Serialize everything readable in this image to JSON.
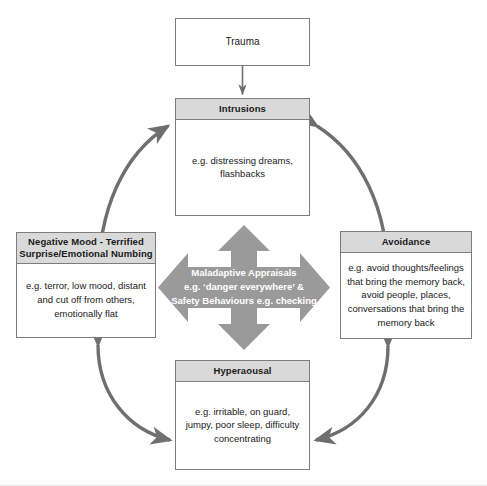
{
  "diagram": {
    "colors": {
      "header_fill": "#d9d9d9",
      "box_border": "#7d7d7d",
      "box_fill": "#ffffff",
      "cross_arrow_fill": "#9a9a9a",
      "curved_arrow_stroke": "#6f6f6f",
      "text": "#1a1a1a",
      "cross_label_text": "#ffffff",
      "background": "#ffffff"
    },
    "nodes": {
      "trauma": {
        "label": "Trauma"
      },
      "intrusions": {
        "header": "Intrusions",
        "body": "e.g. distressing dreams, flashbacks"
      },
      "negative_mood": {
        "header": "Negative Mood - Terrified Surprise/Emotional Numbing",
        "header_line1": "Negative Mood - Terrified",
        "header_line2": "Surprise/Emotional Numbing",
        "body": "e.g. terror, low mood, distant and cut off from others, emotionally flat"
      },
      "avoidance": {
        "header": "Avoidance",
        "body": "e.g. avoid thoughts/feelings that bring the memory back, avoid people, places, conversations that bring the memory back"
      },
      "hyperarousal": {
        "header": "Hyperaousal",
        "body": "e.g. irritable, on guard, jumpy, poor sleep, difficulty concentrating"
      },
      "central": {
        "line1": "Maladaptive Appraisals",
        "line2": "e.g. ‘danger everywhere’ &",
        "line3": "Safety Behaviours e.g. checking"
      }
    },
    "connectors": [
      {
        "name": "trauma-to-intrusions",
        "from": "Trauma",
        "to": "Intrusions",
        "style": "straight",
        "heads": "single"
      },
      {
        "name": "intrusions-negative-mood",
        "from": "Intrusions",
        "to": "Negative Mood",
        "style": "curved",
        "heads": "double"
      },
      {
        "name": "intrusions-avoidance",
        "from": "Intrusions",
        "to": "Avoidance",
        "style": "curved",
        "heads": "double"
      },
      {
        "name": "negative-mood-hyperarousal",
        "from": "Negative Mood",
        "to": "Hyperaousal",
        "style": "curved",
        "heads": "double"
      },
      {
        "name": "avoidance-hyperarousal",
        "from": "Avoidance",
        "to": "Hyperaousal",
        "style": "curved",
        "heads": "double"
      },
      {
        "name": "central-cross-arrow",
        "from": "Maladaptive Appraisals",
        "to": "all four nodes",
        "style": "cross",
        "heads": "four"
      }
    ]
  }
}
